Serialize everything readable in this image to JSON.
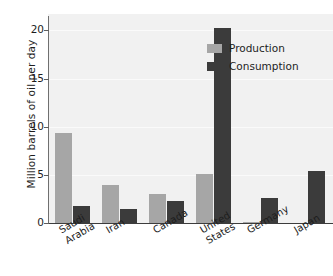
{
  "chart_data": {
    "type": "bar",
    "title": "",
    "xlabel": "",
    "ylabel": "Million barrels of oil per day",
    "ylim": [
      0,
      21.5
    ],
    "yticks": [
      0,
      5,
      10,
      15,
      20
    ],
    "ytick_labels": [
      "0",
      "5",
      "10",
      "15",
      "20"
    ],
    "grid": false,
    "legend_position": "top-right",
    "categories": [
      "Saudi Arabia",
      "Iran",
      "Canada",
      "United States",
      "Germany",
      "Japan"
    ],
    "category_lines": [
      [
        "Saudi",
        "Arabia"
      ],
      [
        "Iran"
      ],
      [
        "Canada"
      ],
      [
        "United",
        "States"
      ],
      [
        "Germany"
      ],
      [
        "Japan"
      ]
    ],
    "series": [
      {
        "name": "Production",
        "color": "#a6a6a6",
        "values": [
          9.3,
          4.0,
          3.0,
          5.1,
          0.1,
          0.0
        ]
      },
      {
        "name": "Consumption",
        "color": "#3b3b3b",
        "values": [
          1.8,
          1.5,
          2.3,
          20.3,
          2.6,
          5.4
        ]
      }
    ]
  },
  "legend": {
    "items": [
      {
        "label": "Production"
      },
      {
        "label": "Consumption"
      }
    ]
  }
}
